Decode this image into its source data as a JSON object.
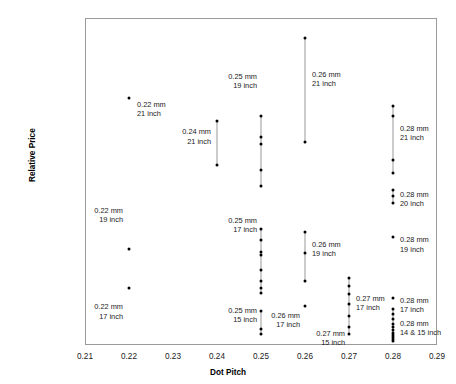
{
  "chart_data": {
    "type": "scatter",
    "title": "",
    "xlabel": "Dot Pitch",
    "ylabel": "Relative Price",
    "xlim": [
      0.21,
      0.29
    ],
    "ylim": [
      0,
      100
    ],
    "grid": false,
    "legend": "none",
    "xticks": [
      "0.21",
      "0.22",
      "0.23",
      "0.24",
      "0.25",
      "0.26",
      "0.27",
      "0.28",
      "0.29"
    ],
    "yticks": [],
    "note": "Vertical line connects min and max price within each dot-pitch / screen-size group; y axis is unlabeled relative price.",
    "groups": [
      {
        "name": "0.22 mm 21 inch",
        "dot_pitch": 0.22,
        "screen_size": "21 inch",
        "x": 0.22,
        "values": [
          75.5
        ],
        "connector": false,
        "label": {
          "line1": "0.22 mm",
          "line2": "21 inch",
          "side": "right",
          "dx": 8,
          "y": 73.5
        }
      },
      {
        "name": "0.22 mm 19 inch",
        "dot_pitch": 0.22,
        "screen_size": "19 inch",
        "x": 0.22,
        "values": [
          29.5
        ],
        "connector": false,
        "label": {
          "line1": "0.22 mm",
          "line2": "19 inch",
          "side": "left",
          "dx": -6,
          "y": 41.0
        }
      },
      {
        "name": "0.22 mm 17 inch",
        "dot_pitch": 0.22,
        "screen_size": "17 inch",
        "x": 0.22,
        "values": [
          17.5
        ],
        "connector": false,
        "label": {
          "line1": "0.22 mm",
          "line2": "17 inch",
          "side": "left",
          "dx": -6,
          "y": 11.5
        }
      },
      {
        "name": "0.24 mm 21 inch",
        "dot_pitch": 0.24,
        "screen_size": "21 inch",
        "x": 0.24,
        "values": [
          68.5,
          55.0
        ],
        "connector": true,
        "label": {
          "line1": "0.24 mm",
          "line2": "21 inch",
          "side": "left",
          "dx": -6,
          "y": 65.0
        }
      },
      {
        "name": "0.25 mm 19 inch",
        "dot_pitch": 0.25,
        "screen_size": "19 inch",
        "x": 0.25,
        "values": [
          70.0,
          63.5,
          61.5,
          53.5,
          48.5
        ],
        "connector": true,
        "label": {
          "line1": "0.25 mm",
          "line2": "19 inch",
          "side": "left",
          "dx": -4,
          "y": 82.0
        }
      },
      {
        "name": "0.25 mm 17 inch",
        "dot_pitch": 0.25,
        "screen_size": "17 inch",
        "x": 0.25,
        "values": [
          35.5,
          32.0,
          28.5,
          27.5,
          23.0,
          19.5,
          17.5,
          16.0
        ],
        "connector": true,
        "label": {
          "line1": "0.25 mm",
          "line2": "17 inch",
          "side": "left",
          "dx": -4,
          "y": 38.0
        }
      },
      {
        "name": "0.25 mm 15 inch",
        "dot_pitch": 0.25,
        "screen_size": "15 inch",
        "x": 0.25,
        "values": [
          10.5,
          5.0,
          3.5
        ],
        "connector": true,
        "label": {
          "line1": "0.25 mm",
          "line2": "15 inch",
          "side": "left",
          "dx": -4,
          "y": 10.5
        }
      },
      {
        "name": "0.26 mm 21 inch",
        "dot_pitch": 0.26,
        "screen_size": "21 inch",
        "x": 0.26,
        "values": [
          94.0,
          62.0
        ],
        "connector": true,
        "label": {
          "line1": "0.26 mm",
          "line2": "21 inch",
          "side": "right",
          "dx": 7,
          "y": 82.5
        }
      },
      {
        "name": "0.26 mm 19 inch",
        "dot_pitch": 0.26,
        "screen_size": "19 inch",
        "x": 0.26,
        "values": [
          34.5,
          28.0,
          19.5
        ],
        "connector": true,
        "label": {
          "line1": "0.26 mm",
          "line2": "19 inch",
          "side": "right",
          "dx": 7,
          "y": 30.5
        }
      },
      {
        "name": "0.26 mm 17 inch",
        "dot_pitch": 0.26,
        "screen_size": "17 inch",
        "x": 0.26,
        "values": [
          12.0
        ],
        "connector": false,
        "label": {
          "line1": "0.26 mm",
          "line2": "17 inch",
          "side": "left",
          "dx": -5,
          "y": 9.0
        }
      },
      {
        "name": "0.27 mm 17 inch",
        "dot_pitch": 0.27,
        "screen_size": "17 inch",
        "x": 0.27,
        "values": [
          20.5,
          18.0,
          15.5,
          12.5,
          9.0,
          5.5,
          3.5
        ],
        "connector": true,
        "label": {
          "line1": "0.27 mm",
          "line2": "17 inch",
          "side": "right",
          "dx": 7,
          "y": 14.0
        }
      },
      {
        "name": "0.27 mm 15 inch",
        "dot_pitch": 0.27,
        "screen_size": "15 inch",
        "x": 0.27,
        "values": [],
        "connector": false,
        "label": {
          "line1": "0.27 mm",
          "line2": "15 inch",
          "side": "left",
          "dx": -4,
          "y": 3.5
        }
      },
      {
        "name": "0.28 mm 21 inch",
        "dot_pitch": 0.28,
        "screen_size": "21 inch",
        "x": 0.28,
        "values": [
          73.0,
          70.0,
          56.5,
          52.5
        ],
        "connector": true,
        "label": {
          "line1": "0.28 mm",
          "line2": "21 inch",
          "side": "right",
          "dx": 7,
          "y": 66.0
        }
      },
      {
        "name": "0.28 mm 20 inch",
        "dot_pitch": 0.28,
        "screen_size": "20 inch",
        "x": 0.28,
        "values": [
          47.5,
          45.5,
          43.5
        ],
        "connector": true,
        "label": {
          "line1": "0.28 mm",
          "line2": "20 inch",
          "side": "right",
          "dx": 7,
          "y": 46.0
        }
      },
      {
        "name": "0.28 mm 19 inch",
        "dot_pitch": 0.28,
        "screen_size": "19 inch",
        "x": 0.28,
        "values": [
          33.0
        ],
        "connector": false,
        "label": {
          "line1": "0.28 mm",
          "line2": "19 inch",
          "side": "right",
          "dx": 7,
          "y": 32.0
        }
      },
      {
        "name": "0.28 mm 17 inch",
        "dot_pitch": 0.28,
        "screen_size": "17 inch",
        "x": 0.28,
        "values": [
          14.5
        ],
        "connector": false,
        "label": {
          "line1": "0.28 mm",
          "line2": "17 inch",
          "side": "right",
          "dx": 7,
          "y": 13.5
        }
      },
      {
        "name": "0.28 mm 14 & 15 inch",
        "dot_pitch": 0.28,
        "screen_size": "14 & 15 inch",
        "x": 0.28,
        "values": [
          11.0,
          9.5,
          8.0,
          6.5,
          5.5,
          4.5,
          3.8,
          3.0,
          2.4,
          1.8,
          1.2
        ],
        "connector": true,
        "label": {
          "line1": "0.28 mm",
          "line2": "14 & 15 inch",
          "side": "right",
          "dx": 7,
          "y": 6.5
        }
      }
    ]
  }
}
